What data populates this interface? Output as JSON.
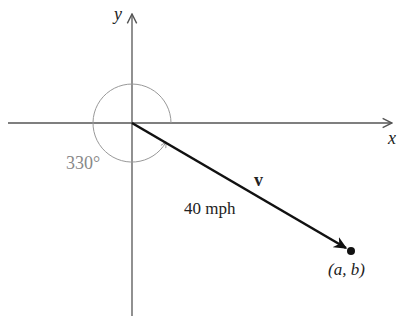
{
  "diagram": {
    "axes": {
      "x_label": "x",
      "y_label": "y"
    },
    "angle": {
      "label": "330°",
      "degrees": 330
    },
    "vector": {
      "name": "v",
      "magnitude_label": "40 mph"
    },
    "endpoint": {
      "label": "(a, b)"
    },
    "colors": {
      "axis": "#555555",
      "vector": "#111111",
      "angle_arc": "#999999",
      "angle_text": "#888888"
    }
  }
}
